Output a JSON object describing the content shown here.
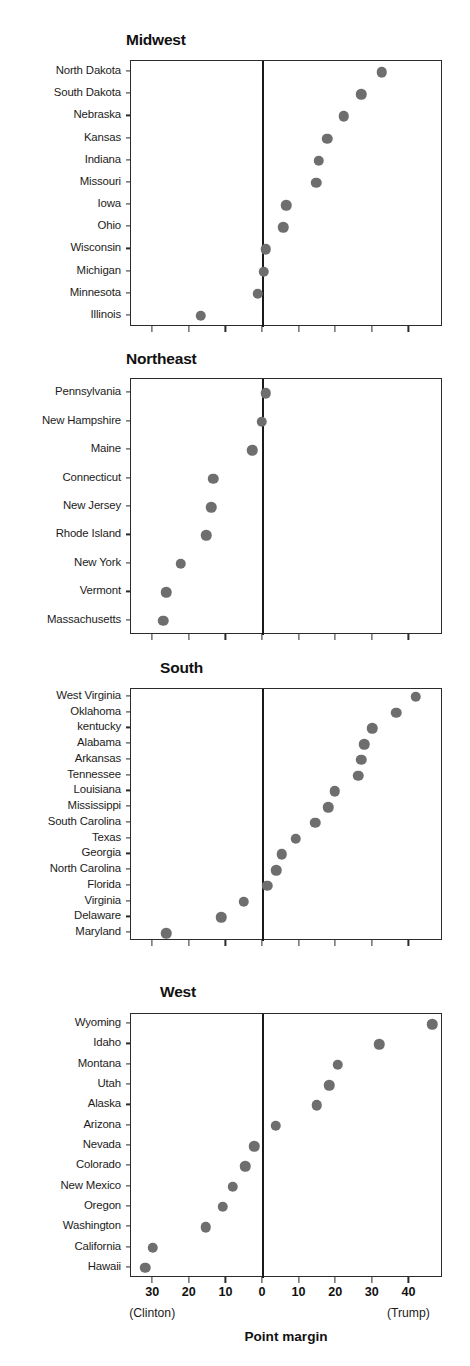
{
  "figure": {
    "axis_title": "Point margin",
    "left_end_label": "(Clinton)",
    "right_end_label": "(Trump)",
    "marker_color": "#6e6e6e",
    "axis_color": "#2b2b2b",
    "zero_line_color": "#1a1a1a"
  },
  "chart_data": [
    {
      "type": "scatter",
      "title": "Midwest",
      "xlabel": "Point margin",
      "ylabel": "",
      "xlim": [
        -36,
        49
      ],
      "xticks": [
        -30,
        -20,
        -10,
        0,
        10,
        20,
        30,
        40
      ],
      "xticklabels": [
        "30",
        "20",
        "10",
        "0",
        "10",
        "20",
        "30",
        "40"
      ],
      "grid": false,
      "legend": "none",
      "annotations": [
        "(Clinton)",
        "(Trump)"
      ],
      "categories": [
        "North Dakota",
        "South Dakota",
        "Nebraska",
        "Kansas",
        "Indiana",
        "Missouri",
        "Iowa",
        "Ohio",
        "Wisconsin",
        "Michigan",
        "Minnesota",
        "Illinois"
      ],
      "values": [
        32.5,
        26.8,
        22.0,
        17.5,
        15.3,
        14.5,
        6.3,
        5.5,
        0.7,
        0.2,
        -1.5,
        -17.0
      ]
    },
    {
      "type": "scatter",
      "title": "Northeast",
      "xlabel": "Point margin",
      "ylabel": "",
      "xlim": [
        -36,
        49
      ],
      "xticks": [
        -30,
        -20,
        -10,
        0,
        10,
        20,
        30,
        40
      ],
      "xticklabels": [
        "30",
        "20",
        "10",
        "0",
        "10",
        "20",
        "30",
        "40"
      ],
      "grid": false,
      "legend": "none",
      "annotations": [
        "(Clinton)",
        "(Trump)"
      ],
      "categories": [
        "Pennsylvania",
        "New Hampshire",
        "Maine",
        "Connecticut",
        "New Jersey",
        "Rhode Island",
        "New York",
        "Vermont",
        "Massachusetts"
      ],
      "values": [
        0.7,
        -0.4,
        -3.0,
        -13.6,
        -14.1,
        -15.5,
        -22.5,
        -26.4,
        -27.2
      ]
    },
    {
      "type": "scatter",
      "title": "South",
      "xlabel": "Point margin",
      "ylabel": "",
      "xlim": [
        -36,
        49
      ],
      "xticks": [
        -30,
        -20,
        -10,
        0,
        10,
        20,
        30,
        40
      ],
      "xticklabels": [
        "30",
        "20",
        "10",
        "0",
        "10",
        "20",
        "30",
        "40"
      ],
      "grid": false,
      "legend": "none",
      "annotations": [
        "(Clinton)",
        "(Trump)"
      ],
      "categories": [
        "West Virginia",
        "Oklahoma",
        "kentucky",
        "Alabama",
        "Arkansas",
        "Tennessee",
        "Louisiana",
        "Mississippi",
        "South Carolina",
        "Texas",
        "Georgia",
        "North Carolina",
        "Florida",
        "Virginia",
        "Delaware",
        "Maryland"
      ],
      "values": [
        41.7,
        36.4,
        29.8,
        27.7,
        26.9,
        26.0,
        19.6,
        17.8,
        14.3,
        9.0,
        5.1,
        3.6,
        1.2,
        -5.3,
        -11.4,
        -26.4
      ]
    },
    {
      "type": "scatter",
      "title": "West",
      "xlabel": "Point margin",
      "ylabel": "",
      "xlim": [
        -36,
        49
      ],
      "xticks": [
        -30,
        -20,
        -10,
        0,
        10,
        20,
        30,
        40
      ],
      "xticklabels": [
        "30",
        "20",
        "10",
        "0",
        "10",
        "20",
        "30",
        "40"
      ],
      "grid": false,
      "legend": "none",
      "annotations": [
        "(Clinton)",
        "(Trump)"
      ],
      "categories": [
        "Wyoming",
        "Idaho",
        "Montana",
        "Utah",
        "Alaska",
        "Arizona",
        "Nevada",
        "Colorado",
        "New Mexico",
        "Oregon",
        "Washington",
        "California",
        "Hawaii"
      ],
      "values": [
        46.3,
        31.8,
        20.4,
        18.1,
        14.7,
        3.5,
        -2.4,
        -4.9,
        -8.2,
        -11.0,
        -15.7,
        -30.1,
        -32.2
      ]
    }
  ]
}
